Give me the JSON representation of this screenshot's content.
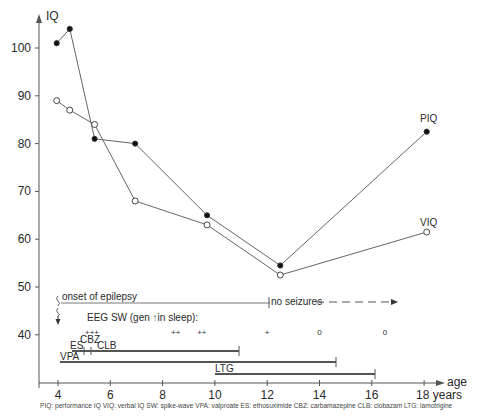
{
  "chart_data": {
    "type": "line",
    "title": "",
    "xlabel": "age",
    "ylabel": "IQ",
    "xlim": [
      3.5,
      19
    ],
    "ylim": [
      31,
      106
    ],
    "x_ticks": [
      4,
      6,
      8,
      10,
      12,
      14,
      16,
      18
    ],
    "x_tick_labels": [
      "4",
      "6",
      "8",
      "10",
      "12",
      "14",
      "16",
      "18 years"
    ],
    "y_ticks": [
      40,
      50,
      60,
      70,
      80,
      90,
      100
    ],
    "y_tick_labels": [
      "40",
      "50",
      "60",
      "70",
      "80",
      "90",
      "100"
    ],
    "grid": false,
    "series": [
      {
        "name": "PIQ",
        "marker": "filled-circle",
        "x": [
          3.95,
          4.45,
          5.4,
          6.95,
          9.7,
          12.5,
          18.1
        ],
        "values": [
          101,
          104,
          81,
          80,
          65,
          54.5,
          82.5
        ]
      },
      {
        "name": "VIQ",
        "marker": "open-circle",
        "x": [
          3.95,
          4.45,
          5.4,
          6.95,
          9.7,
          12.5,
          18.1
        ],
        "values": [
          89,
          87,
          84,
          68,
          63,
          52.5,
          61.5
        ]
      }
    ],
    "annotations": {
      "onset": {
        "label": "onset of epilepsy",
        "start": 4,
        "end": 12
      },
      "no_seizures": {
        "label": "no seizures",
        "start": 12,
        "end": 17.2
      },
      "eeg": {
        "label": "EEG SW (gen ↑in sleep):",
        "marks": [
          {
            "age": 5.3,
            "value": "+++"
          },
          {
            "age": 8.5,
            "value": "++"
          },
          {
            "age": 9.5,
            "value": "++"
          },
          {
            "age": 12,
            "value": "+"
          },
          {
            "age": 14,
            "value": "0"
          },
          {
            "age": 16.5,
            "value": "0"
          }
        ]
      },
      "drugs": [
        {
          "label": "ES",
          "start": 4.5,
          "end": 10.9,
          "ticks": [
            5.0,
            5.3
          ]
        },
        {
          "label": "CBZ",
          "start": 5.0,
          "end": 5.3
        },
        {
          "label": "CLB",
          "start": 5.3,
          "end": 10.9
        },
        {
          "label": "VPA",
          "start": 4.1,
          "end": 14.6
        },
        {
          "label": "LTG",
          "start": 10.0,
          "end": 16.0
        }
      ]
    },
    "footnote": "PIQ: performance IQ  VIQ: verbal IQ  SW: spike-wave  VPA: valproate  ES: ethosuximide  CBZ: carbamazepine  CLB: clobazam  LTG: lamotrigine"
  },
  "labels": {
    "y_axis": "IQ",
    "x_axis": "age",
    "piq": "PIQ",
    "viq": "VIQ",
    "onset": "onset of epilepsy",
    "no_seizures": "no seizures",
    "eeg": "EEG SW (gen ↑in sleep):",
    "eeg_marks": [
      "+++",
      "++",
      "++",
      "+",
      "0",
      "0"
    ],
    "es": "ES",
    "cbz": "CBZ",
    "clb": "CLB",
    "vpa": "VPA",
    "ltg": "LTG",
    "footnote": "PIQ: performance IQ  VIQ: verbal IQ  SW: spike-wave  VPA: valproate  ES: ethosuximide  CBZ: carbamazepine  CLB: clobazam  LTG: lamotrigine"
  }
}
